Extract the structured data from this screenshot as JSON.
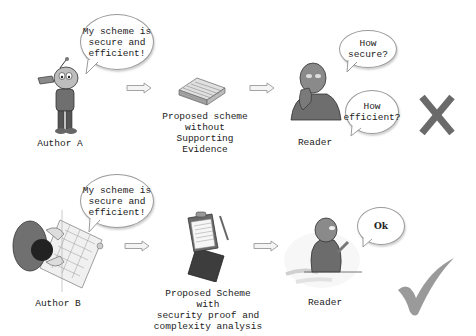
{
  "scenario_a": {
    "author_label": "Author A",
    "author_speech": "My scheme is\nsecure and\nefficient!",
    "document_caption": "Proposed scheme\nwithout Supporting\nEvidence",
    "reader_label": "Reader",
    "reader_question_1": "How secure?",
    "reader_question_2": "How\nefficient?",
    "verdict": "reject",
    "verdict_icon": "cross-icon",
    "verdict_color": "#6a6a6a"
  },
  "scenario_b": {
    "author_label": "Author B",
    "author_speech": "My scheme is\nsecure and\nefficient!",
    "document_caption": "Proposed Scheme with\nsecurity proof and\ncomplexity analysis",
    "reader_label": "Reader",
    "reader_response": "Ok",
    "verdict": "accept",
    "verdict_icon": "check-icon",
    "verdict_color": "#9a9a9a"
  }
}
